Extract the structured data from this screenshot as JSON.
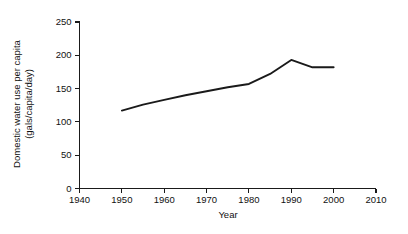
{
  "chart_data": {
    "type": "line",
    "title": "",
    "subtitle": "",
    "xlabel": "Year",
    "ylabel": "Domestic water use per capita (gals/capita/day)",
    "ylabel_line1": "Domestic water use per capita",
    "ylabel_line2": "(gals/capita/day)",
    "xlim": [
      1940,
      2010
    ],
    "ylim": [
      0,
      250
    ],
    "xticks": [
      1940,
      1950,
      1960,
      1970,
      1980,
      1990,
      2000,
      2010
    ],
    "xtick_labels": [
      "1940",
      "1950",
      "1960",
      "1970",
      "1980",
      "1990",
      "2000",
      "2010"
    ],
    "yticks": [
      0,
      50,
      100,
      150,
      200,
      250
    ],
    "ytick_labels": [
      "0",
      "50",
      "100",
      "150",
      "200",
      "250"
    ],
    "grid": false,
    "legend": false,
    "legend_position": "none",
    "line_color": "#1a1a1a",
    "axis_color": "#1a1a1a",
    "background_color": "#ffffff",
    "x": [
      1950,
      1955,
      1960,
      1965,
      1970,
      1975,
      1980,
      1985,
      1990,
      1995,
      2000
    ],
    "values": [
      117,
      126,
      133,
      140,
      146,
      152,
      157,
      172,
      193,
      182,
      182
    ],
    "series": [
      {
        "name": "Domestic water use per capita",
        "x": [
          1950,
          1955,
          1960,
          1965,
          1970,
          1975,
          1980,
          1985,
          1990,
          1995,
          2000
        ],
        "values": [
          117,
          126,
          133,
          140,
          146,
          152,
          157,
          172,
          193,
          182,
          182
        ]
      }
    ]
  }
}
